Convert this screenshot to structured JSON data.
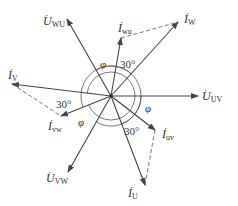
{
  "diagram": {
    "type": "phasor-diagram",
    "center": [
      111,
      96
    ],
    "colors": {
      "line": "#444444",
      "dashed": "#666666",
      "text": "#333333"
    },
    "phasors": [
      {
        "id": "U_UV",
        "kind": "voltage",
        "symbol": "U",
        "sub": "UV",
        "end": [
          198,
          96
        ],
        "label_pos": [
          202,
          90
        ]
      },
      {
        "id": "U_WU",
        "kind": "voltage",
        "symbol": "U",
        "sub": "WU",
        "end": [
          67,
          19
        ],
        "label_pos": [
          43,
          15
        ]
      },
      {
        "id": "U_VW",
        "kind": "voltage",
        "symbol": "U",
        "sub": "VW",
        "end": [
          68,
          172
        ],
        "label_pos": [
          46,
          172
        ]
      },
      {
        "id": "I_W",
        "kind": "current",
        "symbol": "I",
        "sub": "W",
        "end": [
          178,
          22
        ],
        "label_pos": [
          184,
          13
        ]
      },
      {
        "id": "I_wu",
        "kind": "current",
        "symbol": "I",
        "sub": "wu",
        "end": [
          121,
          38
        ],
        "label_pos": [
          118,
          22
        ]
      },
      {
        "id": "I_V",
        "kind": "current",
        "symbol": "I",
        "sub": "V",
        "end": [
          12,
          84
        ],
        "label_pos": [
          8,
          69
        ]
      },
      {
        "id": "I_vw",
        "kind": "current",
        "symbol": "I",
        "sub": "vw",
        "end": [
          61,
          116
        ],
        "label_pos": [
          48,
          120
        ]
      },
      {
        "id": "I_uv",
        "kind": "current",
        "symbol": "I",
        "sub": "uv",
        "end": [
          155,
          130
        ],
        "label_pos": [
          162,
          128
        ]
      },
      {
        "id": "I_U",
        "kind": "current",
        "symbol": "I",
        "sub": "U",
        "end": [
          145,
          185
        ],
        "label_pos": [
          128,
          187
        ]
      }
    ],
    "dashed_links": [
      {
        "from": "I_wu",
        "to": "I_W"
      },
      {
        "from": "I_V",
        "to": "I_vw"
      },
      {
        "from": "I_uv",
        "to": "I_U"
      }
    ],
    "angle_labels": [
      {
        "text": "φ",
        "pos": [
          100,
          59
        ],
        "italic": true
      },
      {
        "text": "30°",
        "pos": [
          120,
          59
        ],
        "italic": false
      },
      {
        "text": "30°",
        "pos": [
          56,
          99
        ],
        "italic": false
      },
      {
        "text": "φ",
        "pos": [
          78,
          117
        ],
        "italic": true
      },
      {
        "text": "φ",
        "pos": [
          145,
          103
        ],
        "italic": true
      },
      {
        "text": "30°",
        "pos": [
          124,
          126
        ],
        "italic": false
      }
    ]
  }
}
